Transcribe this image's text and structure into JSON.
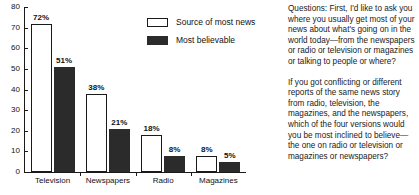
{
  "chart_data": {
    "type": "bar",
    "title": "",
    "xlabel": "",
    "ylabel": "",
    "ylim": [
      0,
      80
    ],
    "yticks": [
      0,
      10,
      20,
      30,
      40,
      50,
      60,
      70,
      80
    ],
    "grid": false,
    "legend_position": "inside-top-right",
    "categories": [
      "Television",
      "Newspapers",
      "Radio",
      "Magazines"
    ],
    "series": [
      {
        "name": "Source of most news",
        "style": "open",
        "values": [
          72,
          38,
          18,
          8
        ],
        "labels": [
          "72%",
          "38%",
          "18%",
          "8%"
        ]
      },
      {
        "name": "Most believable",
        "style": "filled",
        "values": [
          51,
          21,
          8,
          5
        ],
        "labels": [
          "51%",
          "21%",
          "8%",
          "5%"
        ]
      }
    ],
    "ytick_labels": [
      "0",
      "10",
      "20",
      "30",
      "40",
      "50",
      "60",
      "70",
      "80"
    ],
    "colors": {
      "open_fill": "#ffffff",
      "filled_fill": "#2b2b2b",
      "axis": "#1a1a1a",
      "text": "#111111"
    }
  },
  "legend": {
    "items": [
      {
        "label": "Source of most news",
        "style": "open"
      },
      {
        "label": "Most believable",
        "style": "filled"
      }
    ]
  },
  "side_text": {
    "paragraphs": [
      "Questions: First, I'd like to ask you where you usually get most of your news about what's going on in the world today—from the newspapers or radio or television or magazines or talking to people or where?",
      "If you got conflicting or different reports of the same news story from radio, television, the magazines, and the newspapers, which of the four versions would you be most inclined to believe—the one on radio or television or magazines or newspapers?"
    ]
  }
}
